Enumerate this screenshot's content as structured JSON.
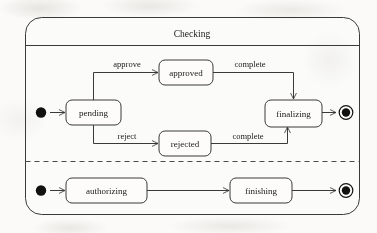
{
  "diagram": {
    "type": "uml-state-machine",
    "composite_state": {
      "name": "Checking",
      "regions": 2
    },
    "regions": [
      {
        "id": "region-upper",
        "states": [
          "pending",
          "approved",
          "rejected",
          "finalizing"
        ],
        "initial_pseudostate": true,
        "final_state": true,
        "transitions": [
          {
            "from": "initial",
            "to": "pending",
            "label": ""
          },
          {
            "from": "pending",
            "to": "approved",
            "label": "approve"
          },
          {
            "from": "pending",
            "to": "rejected",
            "label": "reject"
          },
          {
            "from": "approved",
            "to": "finalizing",
            "label": "complete"
          },
          {
            "from": "rejected",
            "to": "finalizing",
            "label": "complete"
          },
          {
            "from": "finalizing",
            "to": "final",
            "label": ""
          }
        ]
      },
      {
        "id": "region-lower",
        "states": [
          "authorizing",
          "finishing"
        ],
        "initial_pseudostate": true,
        "final_state": true,
        "transitions": [
          {
            "from": "initial",
            "to": "authorizing",
            "label": ""
          },
          {
            "from": "authorizing",
            "to": "finishing",
            "label": ""
          },
          {
            "from": "finishing",
            "to": "final",
            "label": ""
          }
        ]
      }
    ]
  },
  "labels": {
    "composite_title": "Checking",
    "state_pending": "pending",
    "state_approved": "approved",
    "state_rejected": "rejected",
    "state_finalizing": "finalizing",
    "state_authorizing": "authorizing",
    "state_finishing": "finishing",
    "transition_approve": "approve",
    "transition_reject": "reject",
    "transition_complete_top": "complete",
    "transition_complete_bottom": "complete"
  },
  "colors": {
    "paper": "#fbfaf8",
    "ink": "#1a1a1a",
    "stroke": "#3a3a3a",
    "node_fill": "#111111",
    "box_fill": "#fdfcfb"
  }
}
